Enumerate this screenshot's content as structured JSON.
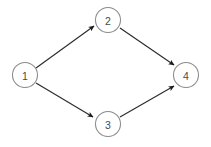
{
  "diagram": {
    "type": "directed-graph",
    "background_color": "#ffffff",
    "node_stroke_color": "#8a8a8a",
    "node_fill_color": "#ffffff",
    "node_label_color": "#4a4a4a",
    "edge_color": "#2b2b2b",
    "arrowhead_color": "#1a1a1a",
    "node_radius": 12.5,
    "nodes": [
      {
        "id": "1",
        "label": "1",
        "cx": 25,
        "cy": 75
      },
      {
        "id": "2",
        "label": "2",
        "cx": 108,
        "cy": 20
      },
      {
        "id": "3",
        "label": "3",
        "cx": 108,
        "cy": 124
      },
      {
        "id": "4",
        "label": "4",
        "cx": 186,
        "cy": 75
      }
    ],
    "edges": [
      {
        "from": "1",
        "to": "2",
        "directed": true,
        "x1": 36,
        "y1": 68,
        "x2": 96,
        "y2": 27
      },
      {
        "from": "1",
        "to": "3",
        "directed": true,
        "x1": 36,
        "y1": 83,
        "x2": 95,
        "y2": 118
      },
      {
        "from": "2",
        "to": "4",
        "directed": true,
        "x1": 120,
        "y1": 28,
        "x2": 176,
        "y2": 66
      },
      {
        "from": "3",
        "to": "4",
        "directed": true,
        "x1": 120,
        "y1": 117,
        "x2": 176,
        "y2": 85
      }
    ]
  }
}
